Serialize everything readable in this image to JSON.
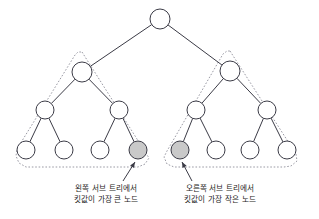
{
  "diagram": {
    "colors": {
      "node_fill": "#ffffff",
      "node_stroke": "#3b3b46",
      "highlight_fill": "#c9c9c9",
      "outline_stroke": "#9a9aa4",
      "text": "#1c1c22",
      "background": "#ffffff"
    },
    "root": {
      "id": "root",
      "cx": 160,
      "cy": 19,
      "r": 10,
      "highlighted": false
    },
    "left_subtree": {
      "name": "left-subtree",
      "outline_points": "82,52 149,158 145,164 138,167 26,167 19,163 16,156 17,149 75,55 78,52",
      "nodes": [
        {
          "id": "L",
          "cx": 82,
          "cy": 72,
          "r": 10,
          "highlighted": false
        },
        {
          "id": "LL",
          "cx": 45,
          "cy": 110,
          "r": 9,
          "highlighted": false
        },
        {
          "id": "LR",
          "cx": 119,
          "cy": 110,
          "r": 9,
          "highlighted": false
        },
        {
          "id": "LLL",
          "cx": 26,
          "cy": 150,
          "r": 9,
          "highlighted": false
        },
        {
          "id": "LLR",
          "cx": 64,
          "cy": 150,
          "r": 9,
          "highlighted": false
        },
        {
          "id": "LRL",
          "cx": 100,
          "cy": 150,
          "r": 9,
          "highlighted": false
        },
        {
          "id": "LRR",
          "cx": 138,
          "cy": 150,
          "r": 9,
          "highlighted": true
        }
      ],
      "edges": [
        {
          "from": "L",
          "to": "LL"
        },
        {
          "from": "L",
          "to": "LR"
        },
        {
          "from": "LL",
          "to": "LLL"
        },
        {
          "from": "LL",
          "to": "LLR"
        },
        {
          "from": "LR",
          "to": "LRL"
        },
        {
          "from": "LR",
          "to": "LRR"
        }
      ]
    },
    "right_subtree": {
      "name": "right-subtree",
      "outline_points": "230,51 296,154 297,161 291,166 284,167 174,167 167,164 164,157 167,151 223,54 227,51",
      "nodes": [
        {
          "id": "R",
          "cx": 230,
          "cy": 71,
          "r": 10,
          "highlighted": false
        },
        {
          "id": "RL",
          "cx": 196,
          "cy": 110,
          "r": 9,
          "highlighted": false
        },
        {
          "id": "RR",
          "cx": 267,
          "cy": 110,
          "r": 9,
          "highlighted": false
        },
        {
          "id": "RLL",
          "cx": 180,
          "cy": 150,
          "r": 9,
          "highlighted": true
        },
        {
          "id": "RLR",
          "cx": 216,
          "cy": 150,
          "r": 9,
          "highlighted": false
        },
        {
          "id": "RRL",
          "cx": 250,
          "cy": 150,
          "r": 9,
          "highlighted": false
        },
        {
          "id": "RRR",
          "cx": 287,
          "cy": 150,
          "r": 9,
          "highlighted": false
        }
      ],
      "edges": [
        {
          "from": "R",
          "to": "RL"
        },
        {
          "from": "R",
          "to": "RR"
        },
        {
          "from": "RL",
          "to": "RLL"
        },
        {
          "from": "RL",
          "to": "RLR"
        },
        {
          "from": "RR",
          "to": "RRL"
        },
        {
          "from": "RR",
          "to": "RRR"
        }
      ]
    },
    "root_edges": [
      {
        "from": "root",
        "to": "L"
      },
      {
        "from": "root",
        "to": "R"
      }
    ],
    "annotations": [
      {
        "name": "left-annotation",
        "target_node": "LRR",
        "arrow": {
          "x1": 123,
          "y1": 181,
          "x2": 135,
          "y2": 162
        },
        "lines": [
          "왼쪽 서브 트리에서",
          "킷값이 가장 큰 노드"
        ],
        "text_x": 106,
        "text_y1": 191,
        "text_y2": 202,
        "text_anchor": "middle"
      },
      {
        "name": "right-annotation",
        "target_node": "RLL",
        "arrow": {
          "x1": 192,
          "y1": 181,
          "x2": 182,
          "y2": 162
        },
        "lines": [
          "오른쪽 서브 트리에서",
          "킷값이 가장 작은 노드"
        ],
        "text_x": 220,
        "text_y1": 191,
        "text_y2": 202,
        "text_anchor": "middle"
      }
    ]
  }
}
